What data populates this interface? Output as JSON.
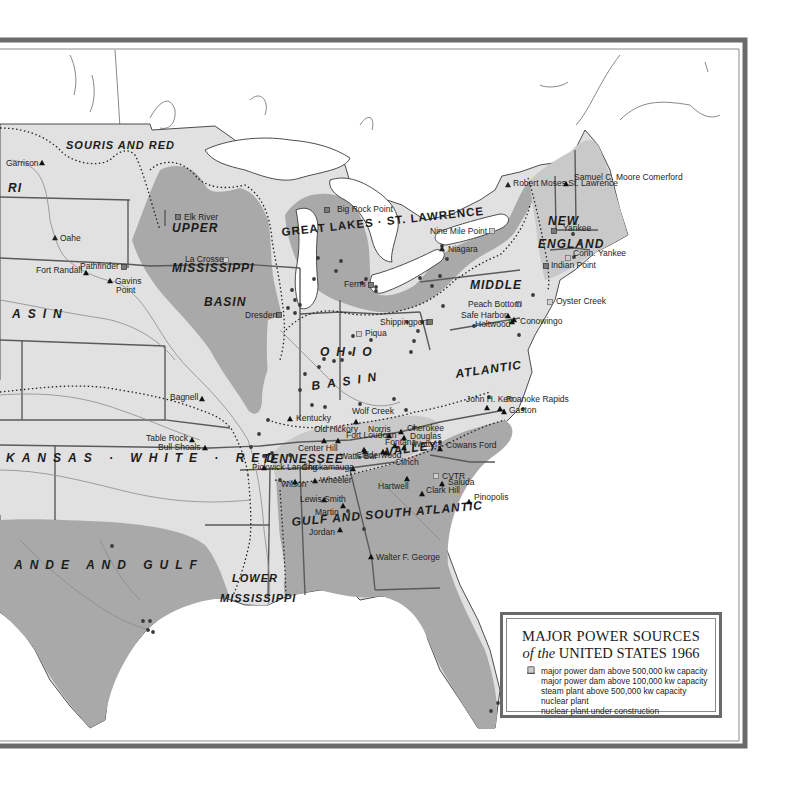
{
  "map": {
    "title_line1": "MAJOR POWER SOURCES",
    "title_line2_prefix": "of the",
    "title_line2_main": "UNITED STATES 1966",
    "colors": {
      "background": "#ffffff",
      "frame": "#6a6a6a",
      "basin_light": "#e1e1e1",
      "basin_mid": "#c9c9c9",
      "basin_dark": "#a9a9a9",
      "water": "#ffffff",
      "boundary": "#5a5a5a",
      "river": "#8a8a8a",
      "symbol": "#222222"
    }
  },
  "legend": {
    "items": [
      {
        "symbol": "dam-large",
        "label": "major power dam above 500,000 kw capacity"
      },
      {
        "symbol": "dam-medium",
        "label": "major power dam above 100,000 kw capacity"
      },
      {
        "symbol": "steam-plant",
        "label": "steam plant above 500,000 kw capacity"
      },
      {
        "symbol": "nuclear-plant",
        "label": "nuclear plant"
      },
      {
        "symbol": "nuclear-construction",
        "label": "nuclear plant under construction"
      }
    ]
  },
  "regions": [
    {
      "name": "SOURIS AND RED",
      "x": 66,
      "y": 149
    },
    {
      "name": "RI",
      "x": 8,
      "y": 192
    },
    {
      "name": "UPPER",
      "x": 172,
      "y": 232
    },
    {
      "name": "MISSISSIPPI",
      "x": 172,
      "y": 272
    },
    {
      "name": "BASIN",
      "x": 204,
      "y": 306
    },
    {
      "name": "ASIN",
      "x": 12,
      "y": 318
    },
    {
      "name": "GREAT LAKES · ST. LAWRENCE",
      "x": 282,
      "y": 236
    },
    {
      "name": "NEW",
      "x": 548,
      "y": 225
    },
    {
      "name": "ENGLAND",
      "x": 538,
      "y": 248
    },
    {
      "name": "MIDDLE",
      "x": 470,
      "y": 289
    },
    {
      "name": "OHIO",
      "x": 320,
      "y": 356
    },
    {
      "name": "BASIN",
      "x": 312,
      "y": 390
    },
    {
      "name": "ATLANTIC",
      "x": 456,
      "y": 378
    },
    {
      "name": "KANSAS · WHITE · RED",
      "x": 6,
      "y": 462
    },
    {
      "name": "TENNESSEE",
      "x": 262,
      "y": 463
    },
    {
      "name": "VALLEY",
      "x": 386,
      "y": 456
    },
    {
      "name": "GULF AND SOUTH ATLANTIC",
      "x": 292,
      "y": 526
    },
    {
      "name": "ANDE AND GULF",
      "x": 14,
      "y": 569
    },
    {
      "name": "LOWER",
      "x": 232,
      "y": 582
    },
    {
      "name": "MISSISSIPPI",
      "x": 220,
      "y": 602
    }
  ],
  "sites": [
    {
      "name": "Garrison",
      "type": "dam-medium",
      "x": 42,
      "y": 163,
      "lx": 6,
      "ly": 166
    },
    {
      "name": "Oahe",
      "type": "dam-large",
      "x": 55,
      "y": 238,
      "lx": 60,
      "ly": 241
    },
    {
      "name": "Fort Randall",
      "type": "dam-medium",
      "x": 86,
      "y": 273,
      "lx": 36,
      "ly": 273
    },
    {
      "name": "Gavins",
      "type": "dam-medium",
      "x": 110,
      "y": 281,
      "lx": 115,
      "ly": 284
    },
    {
      "name": "Point",
      "type": "label-only",
      "x": 0,
      "y": 0,
      "lx": 116,
      "ly": 293
    },
    {
      "name": "Pathfinder",
      "type": "nuclear-plant",
      "x": 124,
      "y": 267,
      "lx": 80,
      "ly": 269
    },
    {
      "name": "Elk River",
      "type": "nuclear-plant",
      "x": 178,
      "y": 217,
      "lx": 184,
      "ly": 220
    },
    {
      "name": "La Crosse",
      "type": "nuclear-construction",
      "x": 226,
      "y": 260,
      "lx": 185,
      "ly": 262
    },
    {
      "name": "Dresden",
      "type": "nuclear-plant",
      "x": 279,
      "y": 315,
      "lx": 245,
      "ly": 318
    },
    {
      "name": "Big Rock Point",
      "type": "nuclear-plant",
      "x": 327,
      "y": 210,
      "lx": 337,
      "ly": 212
    },
    {
      "name": "Fermi",
      "type": "nuclear-plant",
      "x": 371,
      "y": 285,
      "lx": 344,
      "ly": 287
    },
    {
      "name": "Nine Mile Point",
      "type": "nuclear-construction",
      "x": 492,
      "y": 231,
      "lx": 430,
      "ly": 234
    },
    {
      "name": "Niagara",
      "type": "dam-large",
      "x": 442,
      "y": 249,
      "lx": 448,
      "ly": 252
    },
    {
      "name": "Robert Moses St. Lawrence",
      "type": "dam-large",
      "x": 508,
      "y": 185,
      "lx": 513,
      "ly": 186
    },
    {
      "name": "Samuel C. Moore Comerford",
      "type": "dam-medium",
      "x": 566,
      "y": 184,
      "lx": 574,
      "ly": 180
    },
    {
      "name": "Yankee",
      "type": "nuclear-plant",
      "x": 554,
      "y": 231,
      "lx": 563,
      "ly": 231
    },
    {
      "name": "Conn. Yankee",
      "type": "nuclear-construction",
      "x": 568,
      "y": 258,
      "lx": 573,
      "ly": 256
    },
    {
      "name": "Indian Point",
      "type": "nuclear-plant",
      "x": 546,
      "y": 266,
      "lx": 551,
      "ly": 268
    },
    {
      "name": "Oyster Creek",
      "type": "nuclear-construction",
      "x": 550,
      "y": 302,
      "lx": 556,
      "ly": 304
    },
    {
      "name": "Peach Bottom",
      "type": "nuclear-construction",
      "x": 519,
      "y": 304,
      "lx": 468,
      "ly": 307
    },
    {
      "name": "Safe Harbor",
      "type": "dam-medium",
      "x": 508,
      "y": 316,
      "lx": 461,
      "ly": 318
    },
    {
      "name": "Holtwood",
      "type": "dam-medium",
      "x": 512,
      "y": 322,
      "lx": 475,
      "ly": 327
    },
    {
      "name": "Conowingo",
      "type": "dam-medium",
      "x": 514,
      "y": 320,
      "lx": 520,
      "ly": 324
    },
    {
      "name": "Shippingport",
      "type": "nuclear-plant",
      "x": 430,
      "y": 322,
      "lx": 380,
      "ly": 325
    },
    {
      "name": "Piqua",
      "type": "nuclear-construction",
      "x": 359,
      "y": 334,
      "lx": 365,
      "ly": 336
    },
    {
      "name": "Bagnell",
      "type": "dam-medium",
      "x": 202,
      "y": 399,
      "lx": 170,
      "ly": 400
    },
    {
      "name": "Table Rock",
      "type": "dam-medium",
      "x": 192,
      "y": 440,
      "lx": 146,
      "ly": 441
    },
    {
      "name": "Bull Shoals",
      "type": "dam-medium",
      "x": 205,
      "y": 448,
      "lx": 158,
      "ly": 450
    },
    {
      "name": "Kentucky",
      "type": "dam-medium",
      "x": 290,
      "y": 419,
      "lx": 296,
      "ly": 421
    },
    {
      "name": "Wolf Creek",
      "type": "dam-medium",
      "x": 356,
      "y": 422,
      "lx": 352,
      "ly": 414
    },
    {
      "name": "Old Hickory",
      "type": "dam-medium",
      "x": 324,
      "y": 441,
      "lx": 314,
      "ly": 432
    },
    {
      "name": "Fort Loudoun",
      "type": "dam-medium",
      "x": 364,
      "y": 450,
      "lx": 346,
      "ly": 438
    },
    {
      "name": "Norris",
      "type": "dam-medium",
      "x": 389,
      "y": 436,
      "lx": 368,
      "ly": 432
    },
    {
      "name": "Cherokee",
      "type": "dam-medium",
      "x": 401,
      "y": 432,
      "lx": 407,
      "ly": 431
    },
    {
      "name": "Douglas",
      "type": "dam-medium",
      "x": 404,
      "y": 438,
      "lx": 410,
      "ly": 439
    },
    {
      "name": "Fontana",
      "type": "dam-medium",
      "x": 395,
      "y": 446,
      "lx": 385,
      "ly": 445
    },
    {
      "name": "Watters",
      "type": "dam-medium",
      "x": 404,
      "y": 448,
      "lx": 413,
      "ly": 447
    },
    {
      "name": "Center Hill",
      "type": "dam-medium",
      "x": 338,
      "y": 441,
      "lx": 298,
      "ly": 451
    },
    {
      "name": "Watts Bar",
      "type": "dam-medium",
      "x": 365,
      "y": 452,
      "lx": 340,
      "ly": 459
    },
    {
      "name": "Calderwood",
      "type": "dam-medium",
      "x": 386,
      "y": 453,
      "lx": 356,
      "ly": 458
    },
    {
      "name": "Clinch",
      "type": "dam-medium",
      "x": 383,
      "y": 452,
      "lx": 395,
      "ly": 465
    },
    {
      "name": "Pickwick Landing",
      "type": "dam-medium",
      "x": 264,
      "y": 468,
      "lx": 252,
      "ly": 470
    },
    {
      "name": "Chickamauga",
      "type": "dam-medium",
      "x": 353,
      "y": 469,
      "lx": 302,
      "ly": 470
    },
    {
      "name": "Wilson",
      "type": "dam-medium",
      "x": 295,
      "y": 482,
      "lx": 281,
      "ly": 487
    },
    {
      "name": "Wheeler",
      "type": "dam-medium",
      "x": 315,
      "y": 481,
      "lx": 320,
      "ly": 483
    },
    {
      "name": "Lewis Smith",
      "type": "dam-medium",
      "x": 324,
      "y": 500,
      "lx": 300,
      "ly": 502
    },
    {
      "name": "Martin",
      "type": "dam-medium",
      "x": 343,
      "y": 506,
      "lx": 315,
      "ly": 515
    },
    {
      "name": "Jordan",
      "type": "dam-medium",
      "x": 340,
      "y": 530,
      "lx": 309,
      "ly": 535
    },
    {
      "name": "Hartwell",
      "type": "dam-medium",
      "x": 407,
      "y": 479,
      "lx": 378,
      "ly": 489
    },
    {
      "name": "CVTR",
      "type": "nuclear-construction",
      "x": 436,
      "y": 476,
      "lx": 442,
      "ly": 479
    },
    {
      "name": "Saluda",
      "type": "dam-medium",
      "x": 442,
      "y": 484,
      "lx": 448,
      "ly": 485
    },
    {
      "name": "Clark Hill",
      "type": "dam-medium",
      "x": 422,
      "y": 494,
      "lx": 426,
      "ly": 493
    },
    {
      "name": "Pinopolis",
      "type": "dam-medium",
      "x": 469,
      "y": 502,
      "lx": 474,
      "ly": 500
    },
    {
      "name": "Walter F. George",
      "type": "dam-medium",
      "x": 371,
      "y": 557,
      "lx": 376,
      "ly": 560
    },
    {
      "name": "Cowans Ford",
      "type": "dam-medium",
      "x": 440,
      "y": 449,
      "lx": 446,
      "ly": 448
    },
    {
      "name": "John H. Kerr",
      "type": "dam-medium",
      "x": 487,
      "y": 408,
      "lx": 466,
      "ly": 402
    },
    {
      "name": "Roanoke Rapids",
      "type": "dam-medium",
      "x": 500,
      "y": 409,
      "lx": 506,
      "ly": 402
    },
    {
      "name": "Gaston",
      "type": "dam-medium",
      "x": 504,
      "y": 412,
      "lx": 509,
      "ly": 413
    }
  ],
  "steam_plants": [
    [
      292,
      290
    ],
    [
      295,
      300
    ],
    [
      300,
      305
    ],
    [
      288,
      308
    ],
    [
      295,
      313
    ],
    [
      336,
      271
    ],
    [
      318,
      258
    ],
    [
      341,
      261
    ],
    [
      314,
      279
    ],
    [
      366,
      279
    ],
    [
      362,
      283
    ],
    [
      376,
      291
    ],
    [
      376,
      287
    ],
    [
      420,
      278
    ],
    [
      432,
      286
    ],
    [
      440,
      276
    ],
    [
      447,
      259
    ],
    [
      442,
      246
    ],
    [
      443,
      306
    ],
    [
      407,
      322
    ],
    [
      422,
      322
    ],
    [
      418,
      331
    ],
    [
      414,
      341
    ],
    [
      411,
      352
    ],
    [
      350,
      353
    ],
    [
      353,
      336
    ],
    [
      371,
      340
    ],
    [
      334,
      361
    ],
    [
      324,
      359
    ],
    [
      319,
      367
    ],
    [
      305,
      374
    ],
    [
      300,
      390
    ],
    [
      312,
      405
    ],
    [
      325,
      407
    ],
    [
      342,
      360
    ],
    [
      360,
      404
    ],
    [
      394,
      399
    ],
    [
      406,
      410
    ],
    [
      414,
      428
    ],
    [
      440,
      442
    ],
    [
      474,
      326
    ],
    [
      489,
      397
    ],
    [
      523,
      409
    ],
    [
      533,
      295
    ],
    [
      519,
      335
    ],
    [
      573,
      234
    ],
    [
      580,
      243
    ],
    [
      574,
      257
    ],
    [
      268,
      420
    ],
    [
      259,
      434
    ],
    [
      251,
      447
    ],
    [
      264,
      456
    ],
    [
      272,
      453
    ],
    [
      280,
      480
    ],
    [
      290,
      455
    ],
    [
      112,
      546
    ],
    [
      143,
      621
    ],
    [
      150,
      621
    ],
    [
      148,
      630
    ],
    [
      153,
      632
    ],
    [
      498,
      703
    ],
    [
      491,
      711
    ],
    [
      364,
      529
    ],
    [
      348,
      511
    ]
  ]
}
